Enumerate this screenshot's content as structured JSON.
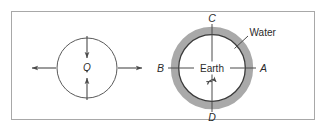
{
  "figure": {
    "border_color": "#a8a8a8",
    "background": "#ffffff",
    "line_color": "#4a4a4a",
    "dark_line_color": "#3a3a3a",
    "water_fill": "#a9a9a9",
    "earth_fill": "#ffffff",
    "text_color": "#2b2b2b",
    "left_panel": {
      "name": "deformed-body-diagram",
      "center_label": "O",
      "circle": {
        "cx": 87,
        "cy": 68,
        "r": 30
      },
      "arrows": [
        {
          "name": "arrow-left-outward",
          "direction": "left",
          "sense": "outward"
        },
        {
          "name": "arrow-right-outward",
          "direction": "right",
          "sense": "outward"
        },
        {
          "name": "arrow-top-inward",
          "direction": "down",
          "sense": "inward"
        },
        {
          "name": "arrow-bottom-inward",
          "direction": "up",
          "sense": "inward"
        }
      ]
    },
    "right_panel": {
      "name": "earth-tides-diagram",
      "earth_label": "Earth",
      "water_label": "Water",
      "point_labels": {
        "top": "C",
        "bottom": "D",
        "right": "A",
        "left": "B"
      },
      "earth_circle": {
        "cx": 212,
        "cy": 68,
        "r": 33
      },
      "water_ring": {
        "cx": 212,
        "cy": 68,
        "r_outer": 41
      },
      "rotation_arrow": {
        "name": "rotation-arrow",
        "sense": "counterclockwise"
      }
    }
  }
}
